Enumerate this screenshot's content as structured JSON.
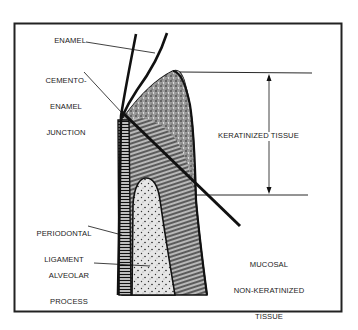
{
  "diagram": {
    "type": "anatomical cross-section",
    "colors": {
      "ink": "#111111",
      "frame": "#222222",
      "background": "#ffffff"
    },
    "labels": {
      "enamel": "ENAMEL",
      "cej_line1": "CEMENTO-",
      "cej_line2": "ENAMEL",
      "cej_line3": "JUNCTION",
      "keratinized": "KERATINIZED TISSUE",
      "pdl_line1": "PERIODONTAL",
      "pdl_line2": "LIGAMENT",
      "alveolar_line1": "ALVEOLAR",
      "alveolar_line2": "PROCESS",
      "mucosal_line1": "MUCOSAL",
      "mucosal_line2": "NON-KERATINIZED",
      "mucosal_line3": "TISSUE"
    }
  }
}
